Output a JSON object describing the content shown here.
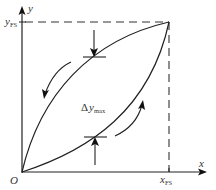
{
  "diagram": {
    "type": "hysteresis-loop",
    "axes": {
      "x_label": "x",
      "y_label": "y",
      "origin_label": "O",
      "x_fullscale": {
        "main": "x",
        "sub": "FS"
      },
      "y_fullscale": {
        "main": "y",
        "sub": "FS"
      }
    },
    "annotation": {
      "delta": "Δ",
      "main": "y",
      "sub": "max"
    },
    "colors": {
      "line": "#222222",
      "dashed": "#333333",
      "text": "#333333",
      "background": "#ffffff"
    }
  }
}
